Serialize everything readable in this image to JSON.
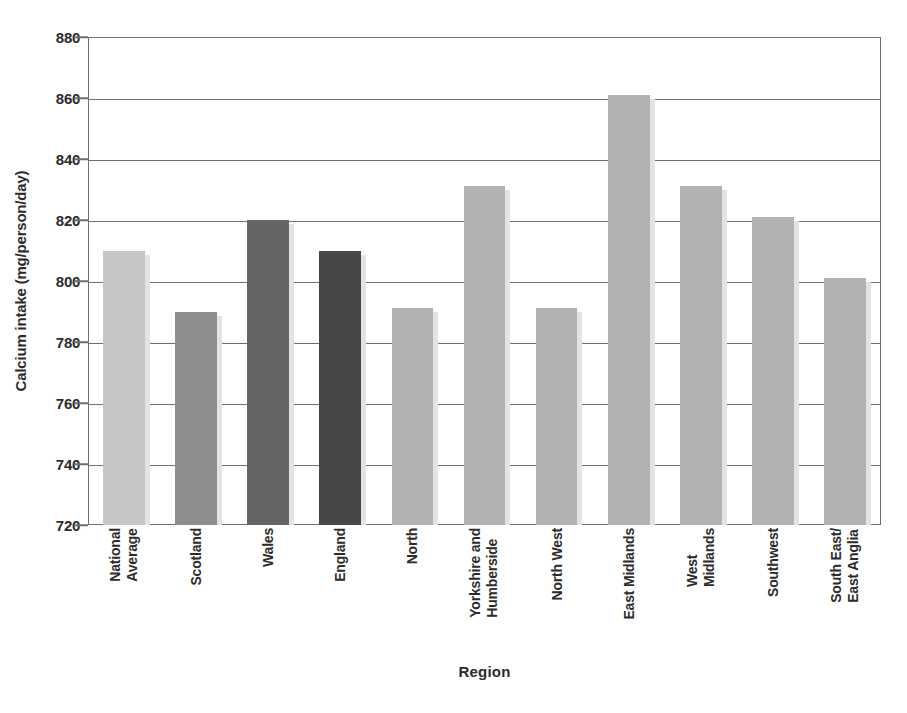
{
  "chart_data": {
    "type": "bar",
    "title": "",
    "xlabel": "Region",
    "ylabel": "Calcium intake (mg/person/day)",
    "ylim": [
      720,
      880
    ],
    "ytick_step": 20,
    "yticks": [
      880,
      860,
      840,
      820,
      800,
      780,
      760,
      740,
      720
    ],
    "grid": true,
    "legend": false,
    "categories": [
      "National Average",
      "Scotland",
      "Wales",
      "England",
      "North",
      "Yorkshire and Humberside",
      "North West",
      "East Midlands",
      "West Midlands",
      "Southwest",
      "South East/East Anglia"
    ],
    "category_lines": [
      [
        "National",
        "Average"
      ],
      [
        "Scotland",
        ""
      ],
      [
        "Wales",
        ""
      ],
      [
        "England",
        ""
      ],
      [
        "North",
        ""
      ],
      [
        "Yorkshire and",
        "Humberside"
      ],
      [
        "North West",
        ""
      ],
      [
        "East Midlands",
        ""
      ],
      [
        "West",
        "Midlands"
      ],
      [
        "Southwest",
        ""
      ],
      [
        "South East/",
        "East Anglia"
      ]
    ],
    "values": [
      810,
      790,
      820,
      810,
      791,
      831,
      791,
      861,
      831,
      821,
      801
    ],
    "bar_colors": [
      "#c6c6c6",
      "#8e8e8e",
      "#656565",
      "#474747",
      "#b2b2b2",
      "#b2b2b2",
      "#b2b2b2",
      "#b2b2b2",
      "#b2b2b2",
      "#b2b2b2",
      "#b2b2b2"
    ]
  },
  "style": {
    "axis_color": "#6f6f6f",
    "text_color": "#2b2b2b",
    "background": "#ffffff",
    "shadow_color": "#e3e3e3"
  }
}
